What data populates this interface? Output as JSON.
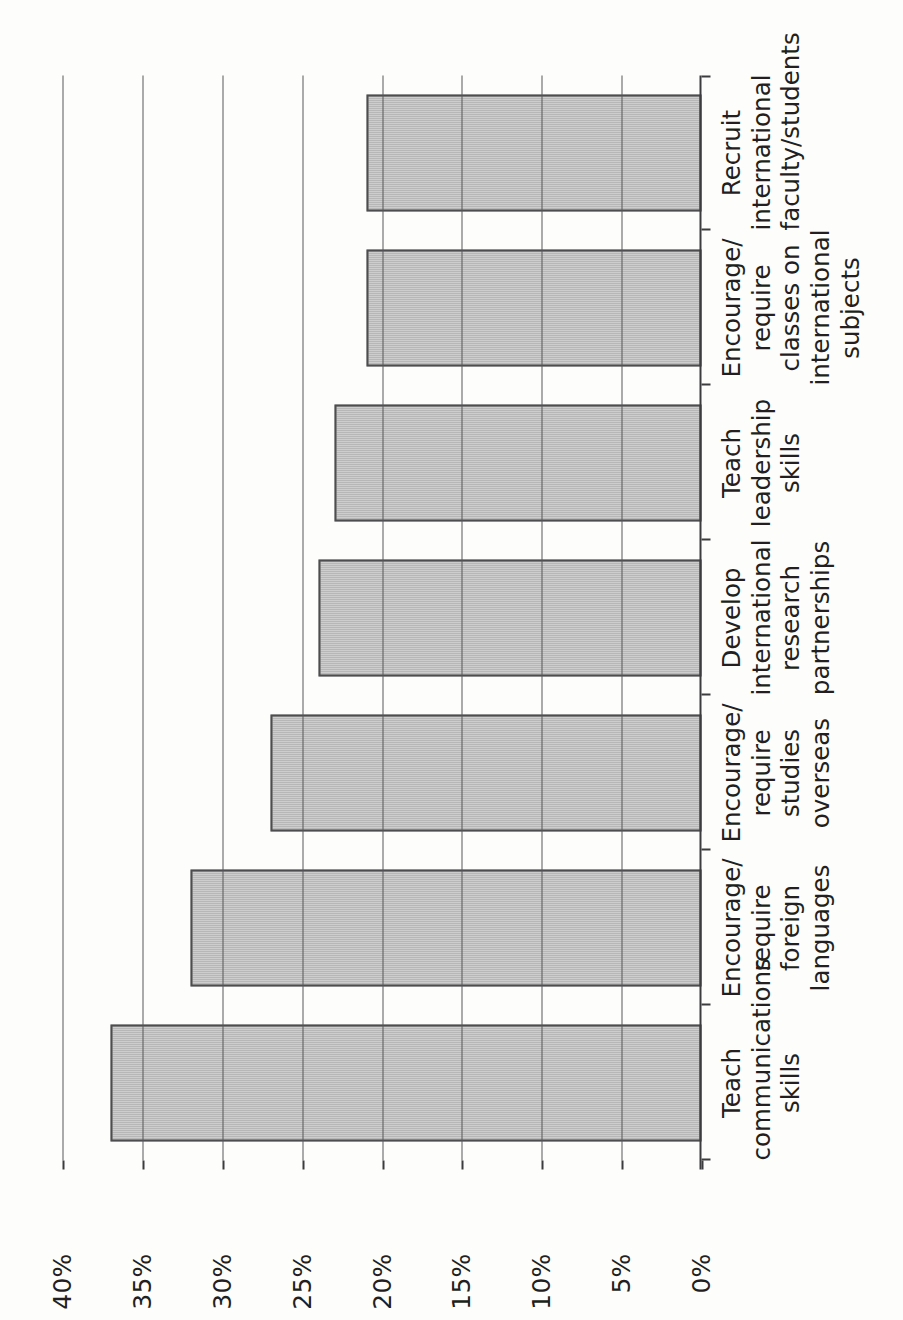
{
  "chart_data": {
    "type": "bar",
    "orientation": "vertical-rotated",
    "title": "",
    "subtitle": "",
    "xlabel": "",
    "ylabel": "",
    "categories": [
      "Teach\ncommunications\nskills",
      "Encourage/\nrequire\nforeign\nlanguages",
      "Encourage/\nrequire\nstudies\noverseas",
      "Develop\ninternational\nresearch\npartnerships",
      "Teach\nleadership\nskills",
      "Encourage/\nrequire\nclasses on\ninternational\nsubjects",
      "Recruit\ninternational\nfaculty/students"
    ],
    "values": [
      37,
      32,
      27,
      24,
      23,
      21,
      21
    ],
    "value_labels": [
      "37%",
      "32%",
      "27%",
      "24%",
      "23%",
      "21%",
      "21%"
    ],
    "ylim": [
      0,
      40
    ],
    "ytick_values": [
      0,
      5,
      10,
      15,
      20,
      25,
      30,
      35,
      40
    ],
    "ytick_labels": [
      "0%",
      "5%",
      "10%",
      "15%",
      "20%",
      "25%",
      "30%",
      "35%",
      "40%"
    ],
    "grid": true,
    "grid_axis": "y",
    "legend": null,
    "legend_position": "none",
    "bar_fill_color": "#a8a8a8",
    "bar_border_color": "#4d4d4f",
    "axis_color": "#3c3c3e",
    "grid_color": "#58585a",
    "background_color": "#ffffff",
    "data_labels_shown": false,
    "page_rotation_degrees": -90
  }
}
